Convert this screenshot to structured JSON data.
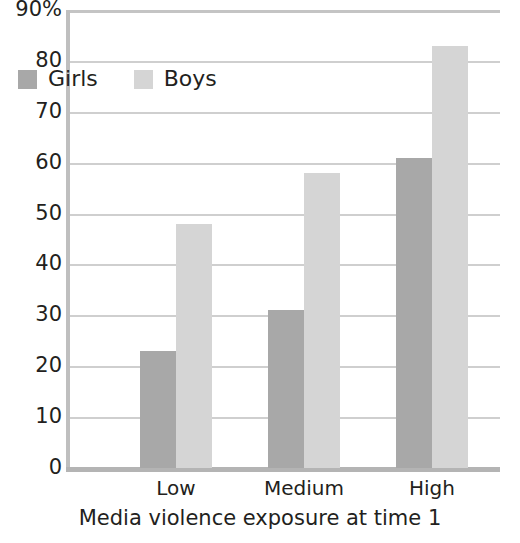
{
  "chart_data": {
    "type": "bar",
    "title": "",
    "xlabel": "Media violence exposure at time 1",
    "ylabel": "",
    "categories": [
      "Low",
      "Medium",
      "High"
    ],
    "series": [
      {
        "name": "Girls",
        "values": [
          23,
          31,
          61
        ],
        "color": "#a8a8a8"
      },
      {
        "name": "Boys",
        "values": [
          48,
          58,
          83
        ],
        "color": "#d5d5d5"
      }
    ],
    "ylim": [
      0,
      90
    ],
    "ytick_values": [
      0,
      10,
      20,
      30,
      40,
      50,
      60,
      70,
      80,
      90
    ],
    "ytick_labels": [
      "0",
      "10",
      "20",
      "30",
      "40",
      "50",
      "60",
      "70",
      "80",
      "90%"
    ],
    "grid": true,
    "legend_position": "upper left",
    "axis_color": "#bfbfbf",
    "gridline_color": "#cfcfcf",
    "text_color": "#231f20",
    "background_color": "#ffffff"
  }
}
